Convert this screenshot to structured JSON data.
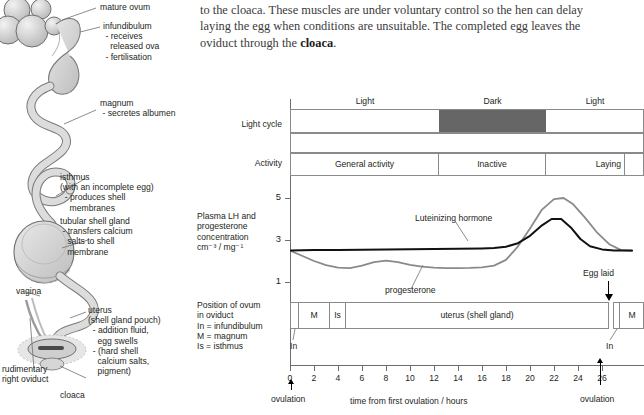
{
  "body_text": {
    "line1": "to the cloaca. These muscles are under voluntary control so the hen can delay",
    "line2": "laying the egg when conditions are unsuitable. The completed egg leaves the",
    "line3_pre": "oviduct through the ",
    "line3_bold": "cloaca",
    "line3_post": "."
  },
  "anatomy": {
    "title": "hen-oviduct-diagram",
    "labels": [
      {
        "id": "mature-ovum",
        "text": "mature ovum"
      },
      {
        "id": "infundibulum",
        "text": "infundibulum\n - receives\n   released ova\n - fertilisation"
      },
      {
        "id": "magnum",
        "text": "magnum\n - secretes albumen"
      },
      {
        "id": "isthmus",
        "text": "isthmus\n(with an incomplete egg)\n  - produces shell\n    membranes"
      },
      {
        "id": "tubular-shell-gland",
        "text": "tubular shell gland\n - transfers calcium\n   salts to shell\n   membrane"
      },
      {
        "id": "vagina",
        "text": "vagina"
      },
      {
        "id": "uterus",
        "text": "uterus\n(shell gland pouch)\n  - addition fluid,\n    egg swells\n  - (hard shell\n    calcium salts,\n    pigment)"
      },
      {
        "id": "rudimentary-right-oviduct",
        "text": "rudimentary\nright oviduct"
      },
      {
        "id": "cloaca",
        "text": "cloaca"
      }
    ]
  },
  "chart_data": {
    "type": "timeline",
    "title": "",
    "xlabel": "time from first ovulation / hours",
    "ylabel": "Plasma LH and progesterone concentration cm⁻³ / mg⁻¹",
    "xlim": [
      -0.5,
      29.5
    ],
    "xticks": [
      0,
      2,
      4,
      6,
      8,
      10,
      12,
      14,
      16,
      18,
      20,
      22,
      24,
      26
    ],
    "yticks": [
      1,
      3,
      5
    ],
    "ylim": [
      0.4,
      5.6
    ],
    "grid": false,
    "row_labels": {
      "light_cycle": "Light cycle",
      "activity": "Activity",
      "concentration": "Plasma LH and\nprogesterone\nconcentration\ncm⁻³ / mg⁻¹",
      "position": "Position of ovum\nin oviduct\nIn = infundibulum\nM = magnum\nIs = isthmus"
    },
    "light_cycle": {
      "header_labels": [
        {
          "label": "Light",
          "from": 0,
          "to": 12.3
        },
        {
          "label": "Dark",
          "from": 12.3,
          "to": 21.2
        },
        {
          "label": "Light",
          "from": 21.2,
          "to": 29.5
        }
      ],
      "segments": [
        {
          "label": "Light",
          "from": 0,
          "to": 12.3,
          "fill": "#ffffff"
        },
        {
          "label": "Dark",
          "from": 12.3,
          "to": 21.2,
          "fill": "#666666"
        },
        {
          "label": "Light",
          "from": 21.2,
          "to": 29.5,
          "fill": "#ffffff"
        }
      ]
    },
    "activity": {
      "segments": [
        {
          "label": "General activity",
          "from": 0,
          "to": 12.3,
          "align": "center"
        },
        {
          "label": "Inactive",
          "from": 12.3,
          "to": 21.2,
          "align": "center"
        },
        {
          "label": "Laying",
          "from": 21.2,
          "to": 27.8,
          "align": "right"
        },
        {
          "label": "",
          "from": 27.8,
          "to": 29.5,
          "align": "center"
        }
      ]
    },
    "series": [
      {
        "name": "Luteinizing hormone",
        "color": "#111111",
        "label_position": {
          "x": 11.0,
          "y": 4.05
        },
        "points": [
          [
            0,
            2.5
          ],
          [
            2,
            2.52
          ],
          [
            4,
            2.53
          ],
          [
            6,
            2.54
          ],
          [
            8,
            2.55
          ],
          [
            10,
            2.56
          ],
          [
            12,
            2.57
          ],
          [
            14,
            2.58
          ],
          [
            16,
            2.6
          ],
          [
            17,
            2.62
          ],
          [
            18,
            2.68
          ],
          [
            19,
            2.85
          ],
          [
            20,
            3.2
          ],
          [
            21,
            3.7
          ],
          [
            21.8,
            4.0
          ],
          [
            22.6,
            4.0
          ],
          [
            23.4,
            3.6
          ],
          [
            24.2,
            3.05
          ],
          [
            25,
            2.7
          ],
          [
            26,
            2.55
          ],
          [
            27,
            2.5
          ],
          [
            28.5,
            2.5
          ]
        ]
      },
      {
        "name": "progesterone",
        "color": "#8a8a8a",
        "label_position": {
          "x": 7.4,
          "y": 0.85
        },
        "points": [
          [
            0,
            2.5
          ],
          [
            1,
            2.25
          ],
          [
            2,
            2.0
          ],
          [
            3,
            1.8
          ],
          [
            4,
            1.68
          ],
          [
            5,
            1.66
          ],
          [
            6,
            1.78
          ],
          [
            7,
            1.95
          ],
          [
            8,
            2.02
          ],
          [
            9,
            1.95
          ],
          [
            10,
            1.82
          ],
          [
            11,
            1.73
          ],
          [
            12,
            1.68
          ],
          [
            13,
            1.66
          ],
          [
            14,
            1.66
          ],
          [
            15,
            1.67
          ],
          [
            16,
            1.7
          ],
          [
            17,
            1.78
          ],
          [
            18,
            2.05
          ],
          [
            19,
            2.7
          ],
          [
            20,
            3.55
          ],
          [
            21,
            4.45
          ],
          [
            22,
            4.95
          ],
          [
            22.8,
            5.0
          ],
          [
            23.6,
            4.7
          ],
          [
            24.6,
            4.05
          ],
          [
            25.6,
            3.35
          ],
          [
            26.6,
            2.8
          ],
          [
            27.6,
            2.52
          ],
          [
            28.5,
            2.48
          ]
        ]
      }
    ],
    "annotations": [
      {
        "id": "egg-laid",
        "text": "Egg laid",
        "x": 26.5,
        "arrow": "down"
      },
      {
        "id": "ovulation-start",
        "text": "ovulation",
        "x": 0,
        "arrow": "up"
      },
      {
        "id": "ovulation-end",
        "text": "ovulation",
        "x": 25.0,
        "arrow": "up"
      }
    ],
    "position_of_ovum": {
      "segments": [
        {
          "label": "",
          "short": "In",
          "from": 0,
          "to": 0.75
        },
        {
          "label": "M",
          "short": "M",
          "from": 0.75,
          "to": 3.35
        },
        {
          "label": "Is",
          "short": "Is",
          "from": 3.35,
          "to": 4.6
        },
        {
          "label": "uterus (shell gland)",
          "short": "U",
          "from": 4.6,
          "to": 26.6
        },
        {
          "label": "",
          "short": "In",
          "from": 27.0,
          "to": 27.6
        },
        {
          "label": "M",
          "short": "M",
          "from": 27.6,
          "to": 29.5
        }
      ],
      "callouts": [
        {
          "text": "In",
          "x": 0.4
        },
        {
          "text": "In",
          "x": 27.2
        }
      ]
    }
  }
}
